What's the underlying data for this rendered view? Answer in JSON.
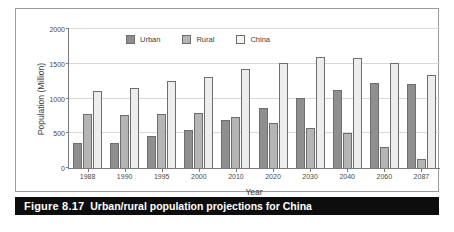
{
  "figure": {
    "caption_label": "Figure 8.17",
    "caption_text": "Urban/rural population projections for China"
  },
  "colors": {
    "urban": "#8f8f8f",
    "rural": "#b5b5b5",
    "china": "#ededed",
    "caption_bar": "#0d0d0d",
    "gridline": "#d8d8d8",
    "axis": "#7a7a7a"
  },
  "chart_data": {
    "type": "bar",
    "title": "",
    "xlabel": "Year",
    "ylabel": "Population (Million)",
    "ylim": [
      0,
      2000
    ],
    "yticks": [
      0,
      500,
      1000,
      1500,
      2000
    ],
    "ytick_labels": [
      "0",
      "500",
      "1000",
      "1500",
      "2000"
    ],
    "grid": true,
    "legend_position": "top-center",
    "categories": [
      "1988",
      "1990",
      "1995",
      "2000",
      "2010",
      "2020",
      "2030",
      "2040",
      "2060",
      "2087"
    ],
    "series": [
      {
        "name": "Urban",
        "color": "#8f8f8f",
        "values": [
          360,
          360,
          460,
          540,
          690,
          865,
          1010,
          1125,
          1230,
          1205
        ]
      },
      {
        "name": "Rural",
        "color": "#b5b5b5",
        "values": [
          775,
          760,
          780,
          795,
          730,
          650,
          580,
          500,
          300,
          130
        ]
      },
      {
        "name": "China",
        "color": "#ededed",
        "values": [
          1110,
          1150,
          1245,
          1310,
          1425,
          1510,
          1600,
          1590,
          1510,
          1340
        ]
      }
    ]
  }
}
